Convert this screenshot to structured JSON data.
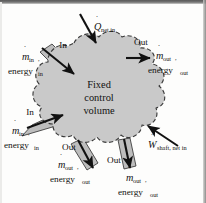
{
  "figure": {
    "name": "fixed-control-volume-energy-balance",
    "type": "diagram",
    "center_label": {
      "line1": "Fixed",
      "line2": "control",
      "line3": "volume"
    },
    "colors": {
      "control_volume_fill": "#c9c9c9",
      "control_volume_edge": "#3a3a3a",
      "duct_fill": "#bdbdbd",
      "duct_edge": "#2b2b2b",
      "arrow": "#111111",
      "background": "#fdfdfc",
      "text": "#111111"
    },
    "heat_transfer": {
      "direction_label": "in",
      "symbol": "Q",
      "dot": "̇",
      "subscript": "net in",
      "arrow_direction": "down-right-into-cv"
    },
    "shaft_work": {
      "direction_label": "in",
      "symbol": "W",
      "dot": "̇",
      "subscript": "shaft, net in",
      "arrow_direction": "up-left-into-cv"
    },
    "ports": [
      {
        "id": "inlet-upper-left",
        "kind": "In",
        "kind_label": "In",
        "mass_symbol": "m",
        "mass_subscript": "in",
        "comma": ",",
        "energy_label": "energy",
        "energy_subscript": "in",
        "arrow_direction": "down-right-into-cv"
      },
      {
        "id": "outlet-upper-right",
        "kind": "Out",
        "kind_label": "Out",
        "mass_symbol": "m",
        "mass_subscript": "out",
        "comma": ",",
        "energy_label": "energy",
        "energy_subscript": "out",
        "arrow_direction": "right-out-of-cv"
      },
      {
        "id": "inlet-lower-left",
        "kind": "In",
        "kind_label": "In",
        "mass_symbol": "m",
        "mass_subscript": "in",
        "comma": ",",
        "energy_label": "energy",
        "energy_subscript": "in",
        "arrow_direction": "up-right-into-cv"
      },
      {
        "id": "outlet-bottom-left",
        "kind": "Out",
        "kind_label": "Out",
        "mass_symbol": "m",
        "mass_subscript": "out",
        "comma": ",",
        "energy_label": "energy",
        "energy_subscript": "out",
        "arrow_direction": "down-left-out-of-cv"
      },
      {
        "id": "outlet-bottom-right",
        "kind": "Out",
        "kind_label": "Out",
        "mass_symbol": "m",
        "mass_subscript": "out",
        "comma": ",",
        "energy_label": "energy",
        "energy_subscript": "out",
        "arrow_direction": "down-left-out-of-cv"
      }
    ]
  }
}
